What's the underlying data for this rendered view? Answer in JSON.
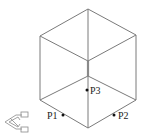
{
  "diagram": {
    "type": "isometric-cube-wireframe",
    "vertices": {
      "top": [
        88,
        9
      ],
      "left": [
        40,
        36
      ],
      "right": [
        136,
        35
      ],
      "inner_top": [
        88,
        61
      ],
      "front_mid": [
        88,
        76
      ],
      "lower_left": [
        40,
        100
      ],
      "lower_right": [
        136,
        100
      ],
      "bottom": [
        88,
        128
      ]
    },
    "points": [
      {
        "label": "P1",
        "x": 63,
        "y": 115
      },
      {
        "label": "P2",
        "x": 114,
        "y": 115
      },
      {
        "label": "P3",
        "x": 87,
        "y": 90
      }
    ],
    "ucs_icon": "ucs-axis-icon",
    "colors": {
      "edge": "#7a7a7a",
      "point": "#111111",
      "label": "#222222"
    }
  }
}
